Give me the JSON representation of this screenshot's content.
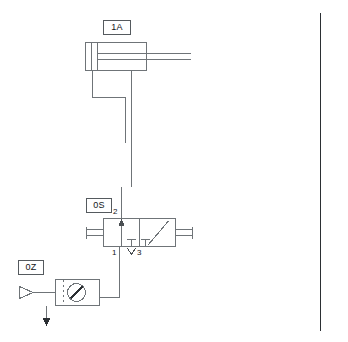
{
  "diagram": {
    "type": "pneumatic-circuit",
    "background": "#ffffff",
    "line_color": "#6f7478",
    "dark_line_color": "#2b2f33",
    "label_border_color": "#555a5e",
    "text_color": "#111416"
  },
  "components": {
    "cylinder": {
      "tag": "1A",
      "name": "double-acting-cylinder",
      "description": "cylinder with piston and rod"
    },
    "valve": {
      "tag": "0S",
      "name": "3-2-way-directional-valve",
      "ports": {
        "supply": "1",
        "output": "2",
        "exhaust": "3"
      }
    },
    "service_unit": {
      "tag": "0Z",
      "name": "air-service-unit",
      "description": "air supply, filter and pressure gauge"
    }
  },
  "divider": {
    "name": "vertical-divider-line"
  }
}
